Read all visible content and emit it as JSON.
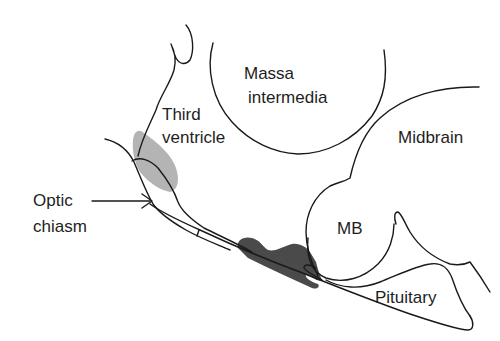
{
  "diagram": {
    "labels": {
      "massa_intermedia_line1": "Massa",
      "massa_intermedia_line2": "intermedia",
      "third_ventricle_line1": "Third",
      "third_ventricle_line2": "ventricle",
      "midbrain": "Midbrain",
      "optic_chiasm_line1": "Optic",
      "optic_chiasm_line2": "chiasm",
      "mammillary_body": "MB",
      "pituitary": "Pituitary"
    },
    "colors": {
      "outline": "#1a1a1a",
      "light_shaded_region": "#b4b4b4",
      "dark_shaded_region": "#4a4a4a",
      "background": "#ffffff"
    },
    "annotations": {
      "optic_chiasm_arrow": "arrow pointing right to optic chiasm"
    }
  }
}
